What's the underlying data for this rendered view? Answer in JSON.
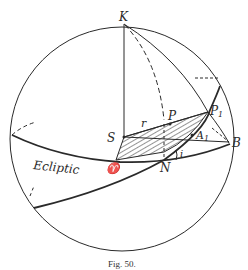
{
  "figure": {
    "caption": "Fig. 50.",
    "labels": {
      "pole": "K",
      "sun": "S",
      "radius": "r",
      "planet": "P",
      "planet_projected": "P",
      "planet_projected_sub": "1",
      "point_a": "A",
      "point_a_sub": "1",
      "point_b": "B",
      "node": "N",
      "vernal_equinox": "♈",
      "inclination": "i",
      "ecliptic": "Ecliptic"
    },
    "colors": {
      "line": "#2a2a2a",
      "background": "#ffffff"
    }
  }
}
